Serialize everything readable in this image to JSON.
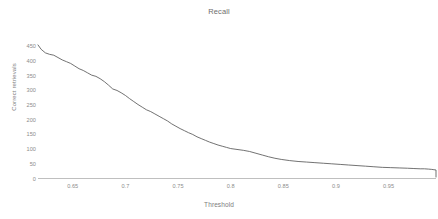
{
  "chart_data": {
    "type": "line",
    "title": "Recall",
    "xlabel": "Threshold",
    "ylabel": "Correct retrievals",
    "xlim": [
      0.617,
      0.995
    ],
    "ylim": [
      0,
      465
    ],
    "grid": false,
    "legend": "none",
    "xticks": [
      "0.65",
      "0.7",
      "0.75",
      "0.8",
      "0.85",
      "0.9",
      "0.95"
    ],
    "xtick_values": [
      0.65,
      0.7,
      0.75,
      0.8,
      0.85,
      0.9,
      0.95
    ],
    "yticks": [
      "450",
      "400",
      "350",
      "300",
      "250",
      "200",
      "150",
      "100",
      "50",
      "0"
    ],
    "ytick_values": [
      450,
      400,
      350,
      300,
      250,
      200,
      150,
      100,
      50,
      0
    ],
    "series": [
      {
        "name": "Correct retrievals",
        "color": "#595959",
        "x": [
          0.617,
          0.62,
          0.624,
          0.628,
          0.632,
          0.636,
          0.64,
          0.644,
          0.648,
          0.652,
          0.656,
          0.66,
          0.664,
          0.668,
          0.672,
          0.676,
          0.68,
          0.684,
          0.688,
          0.692,
          0.696,
          0.7,
          0.704,
          0.708,
          0.712,
          0.716,
          0.72,
          0.724,
          0.728,
          0.732,
          0.736,
          0.74,
          0.744,
          0.748,
          0.752,
          0.756,
          0.76,
          0.764,
          0.768,
          0.772,
          0.776,
          0.78,
          0.784,
          0.788,
          0.792,
          0.796,
          0.8,
          0.806,
          0.812,
          0.818,
          0.824,
          0.83,
          0.836,
          0.842,
          0.848,
          0.856,
          0.864,
          0.872,
          0.88,
          0.888,
          0.896,
          0.904,
          0.912,
          0.92,
          0.928,
          0.936,
          0.944,
          0.952,
          0.96,
          0.968,
          0.974,
          0.98,
          0.984,
          0.988,
          0.991,
          0.993,
          0.995
        ],
        "y": [
          455,
          440,
          428,
          423,
          420,
          412,
          404,
          398,
          392,
          383,
          374,
          368,
          360,
          352,
          348,
          340,
          330,
          318,
          305,
          300,
          292,
          283,
          272,
          262,
          252,
          243,
          234,
          228,
          220,
          212,
          204,
          196,
          186,
          178,
          170,
          163,
          156,
          150,
          142,
          136,
          130,
          124,
          119,
          114,
          110,
          106,
          102,
          99,
          96,
          92,
          86,
          80,
          74,
          69,
          65,
          61,
          58,
          56,
          54,
          52,
          50,
          48,
          46,
          44,
          42,
          40,
          38,
          37,
          36,
          35,
          34,
          33,
          33,
          32,
          31,
          30,
          29
        ]
      }
    ],
    "axis_color": "#bfbfbf",
    "background": "#ffffff"
  },
  "chart": {
    "title": "Recall",
    "x_axis_title": "Threshold",
    "y_axis_title": "Correct retrievals"
  }
}
